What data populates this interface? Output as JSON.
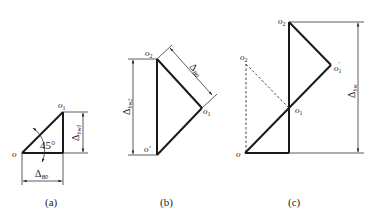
{
  "figures": [
    {
      "id": "a",
      "caption": "(a)",
      "points": {
        "o": "o",
        "o1": "o",
        "o1_sub": "1"
      },
      "angle_label": "45°",
      "dim_horizontal": {
        "main": "Δ",
        "sub": "B0"
      },
      "dim_vertical": {
        "main": "Δ",
        "sub": "bw1"
      }
    },
    {
      "id": "b",
      "caption": "(b)",
      "points": {
        "o2": "o",
        "o2_sub": "2",
        "o1": "o",
        "o1_sub": "1",
        "o_prime": "o'"
      },
      "dim_diagonal": {
        "main": "Δ",
        "sub": "B0"
      },
      "dim_vertical": {
        "main": "Δ",
        "sub": "bw2"
      }
    },
    {
      "id": "c",
      "caption": "(c)",
      "points": {
        "o": "o",
        "o2": "o",
        "o2_sub": "2",
        "o2_left": "o",
        "o2_left_sub": "2",
        "o1": "o",
        "o1_sub": "1",
        "o1_prime": "o",
        "o1_prime_sub": "1",
        "o1_prime_sup": "'"
      },
      "dim_vertical": {
        "main": "Δ",
        "sub": "bw"
      }
    }
  ],
  "colors": {
    "line": "#1a1a1a",
    "thin": "#333333"
  }
}
